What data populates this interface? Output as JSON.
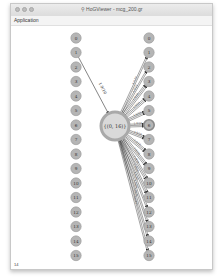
{
  "window": {
    "title": "HoGViewer - mcg_200.gr",
    "title_icon": "graph-viewer-icon",
    "traffic_lights": [
      "close",
      "minimize",
      "zoom"
    ]
  },
  "menubar": {
    "items": [
      {
        "label": "Application"
      }
    ]
  },
  "graph": {
    "left_nodes": [
      "0",
      "1",
      "2",
      "3",
      "4",
      "5",
      "6",
      "7",
      "8",
      "9",
      "10",
      "11",
      "12",
      "13",
      "14",
      "15"
    ],
    "right_nodes": [
      "0",
      "1",
      "2",
      "3",
      "4",
      "5",
      "6",
      "7",
      "8",
      "9",
      "10",
      "11",
      "12",
      "13",
      "14",
      "15"
    ],
    "center_node": {
      "label": "{(0, 16)}"
    },
    "highlighted_right_node": "6",
    "incoming_edge": {
      "from_left": "1",
      "label": "1.9/10"
    },
    "node_fill": "#b5b5b5",
    "node_stroke": "#999999",
    "center_fill": "#d9d9d9",
    "center_stroke": "#a9a9a9",
    "highlight_stroke": "#8a8a8a",
    "edge_color": "#333333"
  },
  "status": {
    "text": "14"
  }
}
